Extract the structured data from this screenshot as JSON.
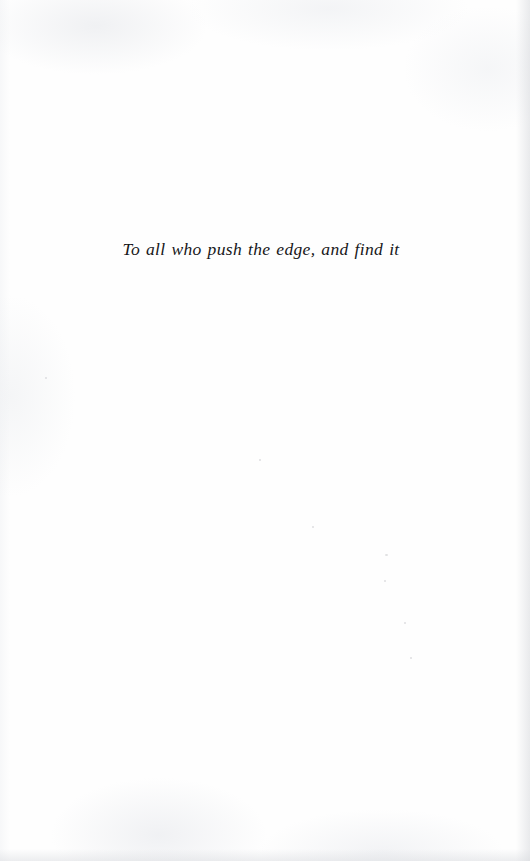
{
  "document": {
    "kind": "book-dedication-page",
    "page_background_color": "#fefefe",
    "ink_color": "#171719"
  },
  "dedication": {
    "text": "To all who push the edge, and find it"
  },
  "artifacts": {
    "specks": [
      {
        "name": "scan-speck-left",
        "x": 45,
        "y": 377,
        "size": 2
      },
      {
        "name": "scan-speck-upper",
        "x": 259,
        "y": 459,
        "size": 2
      },
      {
        "name": "scan-speck-mid",
        "x": 312,
        "y": 526,
        "size": 2
      },
      {
        "name": "scan-speck-right",
        "x": 385,
        "y": 554,
        "size": 2
      },
      {
        "name": "scan-speck-lower",
        "x": 384,
        "y": 580,
        "size": 2
      },
      {
        "name": "scan-speck-bottom",
        "x": 404,
        "y": 622,
        "size": 2
      },
      {
        "name": "scan-speck-edge",
        "x": 410,
        "y": 657,
        "size": 2
      }
    ]
  }
}
